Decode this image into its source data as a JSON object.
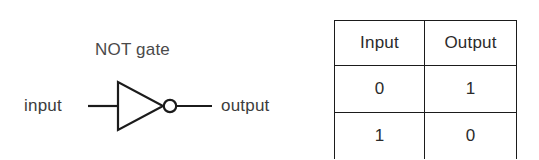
{
  "figure": {
    "background_color": "#ffffff",
    "line_color": "#1b1b1b",
    "text_color": "#3a3a3a"
  },
  "gate": {
    "title": "NOT gate",
    "input_label": "input",
    "output_label": "output",
    "symbol_name": "not-gate-triangle-with-inversion-bubble"
  },
  "truth_table": {
    "headers": [
      "Input",
      "Output"
    ],
    "rows": [
      [
        "0",
        "1"
      ],
      [
        "1",
        "0"
      ]
    ]
  }
}
